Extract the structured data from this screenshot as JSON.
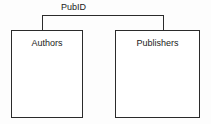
{
  "diagram": {
    "type": "entity-relationship",
    "relationship": {
      "label": "PubID",
      "connects": [
        "Authors",
        "Publishers"
      ]
    },
    "entities": [
      {
        "name": "Authors",
        "label": "Authors"
      },
      {
        "name": "Publishers",
        "label": "Publishers"
      }
    ],
    "colors": {
      "background": "#fdfdfd",
      "line": "#2b2b2b",
      "box_fill": "#ffffff",
      "text": "#1a1a1a"
    }
  }
}
